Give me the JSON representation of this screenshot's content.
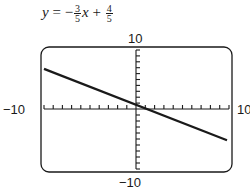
{
  "equation": {
    "lhs": "y",
    "eq": "=",
    "sign": "−",
    "slope_num": "3",
    "slope_den": "5",
    "var": "x",
    "plus": "+",
    "int_num": "4",
    "int_den": "5"
  },
  "axis_labels": {
    "ymax": "10",
    "ymin": "−10",
    "xmin": "−10",
    "xmax": "10"
  },
  "colors": {
    "line": "#1a1a1a",
    "frame": "#1a1a1a",
    "background": "#ffffff"
  },
  "chart_data": {
    "type": "line",
    "xlabel": "",
    "ylabel": "",
    "xlim": [
      -10,
      10
    ],
    "ylim": [
      -10,
      10
    ],
    "grid": false,
    "tick_interval": 1,
    "series": [
      {
        "name": "y = -3/5 x + 4/5",
        "x": [
          -10,
          10
        ],
        "y": [
          6.8,
          -5.2
        ]
      }
    ],
    "frame": "rounded calculator screen"
  }
}
